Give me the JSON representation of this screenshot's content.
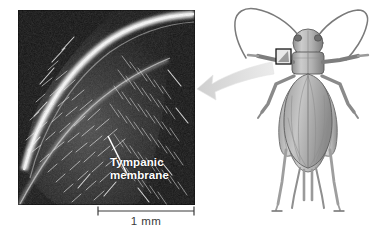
{
  "figure": {
    "type": "scientific-figure",
    "background_color": "#ffffff"
  },
  "micrograph": {
    "name": "scanning-electron-micrograph",
    "description": "dark scanning electron micrograph of cricket foreleg tympanum covered in fine bristles",
    "bounds": {
      "x": 18,
      "y": 10,
      "width": 177,
      "height": 195
    },
    "base_color": "#141414",
    "bristle_color": "#e8e8e8",
    "ridge_color": "#f2f2f2",
    "label": "Tympanic\nmembrane",
    "label_color": "#ffffff",
    "leader_line_color": "#ffffff"
  },
  "scalebar": {
    "name": "scale-bar",
    "label": "1 mm",
    "color": "#3a3a3a",
    "length_px": 98,
    "value": 1,
    "unit": "mm"
  },
  "arrow": {
    "name": "callout-arrow",
    "color": "#d8d8d8",
    "direction": "right-to-left",
    "description": "pale gray curved arrow from cricket foreleg to micrograph"
  },
  "cricket": {
    "name": "cricket-illustration",
    "view": "dorsal",
    "color_light": "#c9c9c9",
    "color_mid": "#9a9a9a",
    "color_dark": "#6a6a6a",
    "outline": "#4a4a4a",
    "callout_box": {
      "name": "tympanum-callout-box",
      "description": "small rectangle marking tympanum on left foreleg tibia",
      "border_color": "#1a1a1a"
    },
    "parts": [
      "antennae",
      "head",
      "pronotum",
      "forewings",
      "abdomen",
      "forelegs",
      "midlegs",
      "hindlegs",
      "cerci"
    ]
  }
}
